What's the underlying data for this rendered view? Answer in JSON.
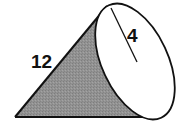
{
  "figure": {
    "type": "cone",
    "orientation": "lying on side, base facing right",
    "labels": {
      "slant_height": "12",
      "radius": "4"
    },
    "colors": {
      "shaded_side": "#8f8f8f",
      "outline": "#111111",
      "base_face": "#ffffff"
    }
  }
}
